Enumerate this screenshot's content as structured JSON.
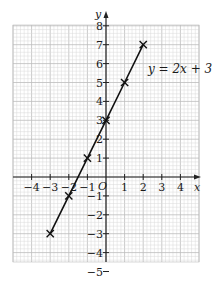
{
  "chart_data": {
    "type": "line",
    "title": "",
    "equation_label": "y = 2x + 3",
    "xlabel": "x",
    "ylabel": "y",
    "origin_label": "O",
    "xlim": [
      -5,
      5
    ],
    "ylim": [
      -5,
      8.5
    ],
    "x_ticks": [
      -4,
      -3,
      -2,
      -1,
      1,
      2,
      3,
      4
    ],
    "x_tick_labels": [
      "−4",
      "−3",
      "−2",
      "−1",
      "1",
      "2",
      "3",
      "4"
    ],
    "y_ticks": [
      -5,
      -4,
      -3,
      -2,
      -1,
      1,
      2,
      3,
      4,
      5,
      6,
      7,
      8
    ],
    "y_tick_labels": [
      "−5",
      "−4",
      "−3",
      "−2",
      "−1",
      "1",
      "2",
      "3",
      "4",
      "5",
      "6",
      "7",
      "8"
    ],
    "grid": true,
    "grid_minor_per_unit": 5,
    "legend": "none",
    "series": [
      {
        "name": "y = 2x + 3",
        "x": [
          -3,
          -2,
          -1,
          0,
          1,
          2
        ],
        "y": [
          -3,
          -1,
          1,
          3,
          5,
          7
        ],
        "marker": "x",
        "color": "#111111"
      }
    ]
  },
  "colors": {
    "grid_minor": "#d9d9d9",
    "grid_major": "#bdbdbd",
    "axis": "#222222",
    "line": "#111111"
  }
}
